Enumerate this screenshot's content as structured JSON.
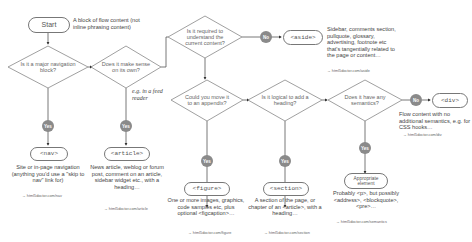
{
  "start": {
    "label": "Start",
    "note": "A block of flow content (not inline phrasing content)"
  },
  "questions": {
    "nav": "Is it a major navigation block?",
    "own": "Does it make sense on its own?",
    "required": "Is it required to understand the current content?",
    "appendix": "Could you move it to an appendix?",
    "heading": "Is it logical to add a heading?",
    "semantics": "Does it have any semantics?"
  },
  "badges": {
    "yes": "Yes",
    "no": "No"
  },
  "annotations": {
    "feed_reader": "e.g. in a feed reader"
  },
  "elements": {
    "nav": {
      "label": "<nav>",
      "desc": "Site or in-page navigation (anything you'd use a \"skip to nav\" link for)",
      "link": "→ html5doctor.com/nav"
    },
    "article": {
      "label": "<article>",
      "desc": "News article, weblog or forum post, comment on an article, sidebar widget etc., with a heading…",
      "link": "→ html5doctor.com/article"
    },
    "aside": {
      "label": "<aside>",
      "desc": "Sidebar, comments section, pullquote, glossary, advertising, footnote etc that's tangentially related to the page or content…",
      "link": "→ html5doctor.com/aside"
    },
    "figure": {
      "label": "<figure>",
      "desc": "One or more images, graphics, code samples etc, plus optional <figcaption>…",
      "link": "→ html5doctor.com/figure"
    },
    "section": {
      "label": "<section>",
      "desc": "A section of the page, or chapter of an <article>, with a heading…",
      "link": "→ html5doctor.com/section"
    },
    "appropriate": {
      "label": "Appropriate element",
      "desc": "Probably <p>, but possibly <address>, <blockquote>, <pre>…",
      "link": "→ html5doctor.com/semantics"
    },
    "div": {
      "label": "<div>",
      "desc": "Flow content with no additional semantics, e.g. for CSS hooks…",
      "link": "→ html5doctor.com/div"
    }
  }
}
